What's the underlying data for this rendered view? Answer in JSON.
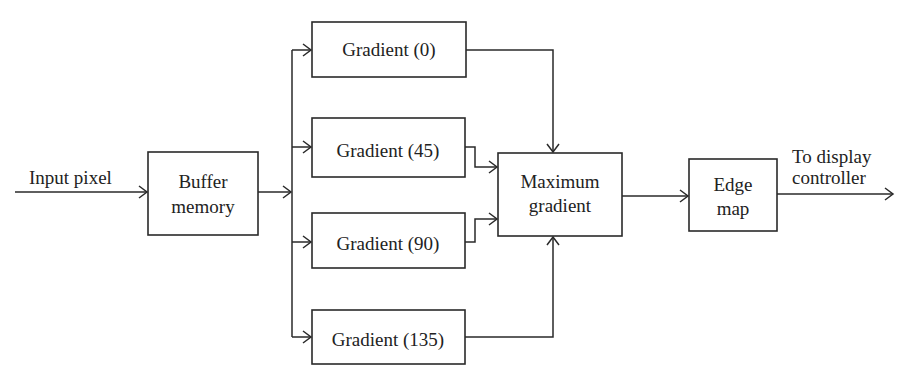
{
  "diagram": {
    "type": "block-diagram",
    "input_label": "Input pixel",
    "output_label": [
      "To display",
      "controller"
    ],
    "blocks": {
      "buffer": [
        "Buffer",
        "memory"
      ],
      "gradient_0": "Gradient (0)",
      "gradient_45": "Gradient (45)",
      "gradient_90": "Gradient (90)",
      "gradient_135": "Gradient (135)",
      "maximum": [
        "Maximum",
        "gradient"
      ],
      "edge_map": [
        "Edge",
        "map"
      ]
    },
    "edges": [
      {
        "from": "Input pixel",
        "to": "Buffer memory"
      },
      {
        "from": "Buffer memory",
        "to": "Gradient (0)"
      },
      {
        "from": "Buffer memory",
        "to": "Gradient (45)"
      },
      {
        "from": "Buffer memory",
        "to": "Gradient (90)"
      },
      {
        "from": "Buffer memory",
        "to": "Gradient (135)"
      },
      {
        "from": "Gradient (0)",
        "to": "Maximum gradient"
      },
      {
        "from": "Gradient (45)",
        "to": "Maximum gradient"
      },
      {
        "from": "Gradient (90)",
        "to": "Maximum gradient"
      },
      {
        "from": "Gradient (135)",
        "to": "Maximum gradient"
      },
      {
        "from": "Maximum gradient",
        "to": "Edge map"
      },
      {
        "from": "Edge map",
        "to": "To display controller"
      }
    ],
    "colors": {
      "stroke": "#2a2a2a",
      "text": "#222222",
      "background": "#ffffff"
    }
  }
}
